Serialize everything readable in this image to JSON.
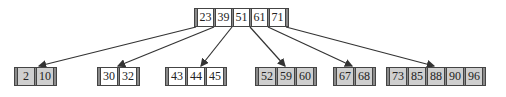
{
  "diagram": {
    "type": "b-tree",
    "root": {
      "keys": [
        "23",
        "39",
        "51",
        "61",
        "71"
      ],
      "fill": "white"
    },
    "leaves": [
      {
        "keys": [
          "2",
          "10"
        ],
        "fill": "gray"
      },
      {
        "keys": [
          "30",
          "32"
        ],
        "fill": "white"
      },
      {
        "keys": [
          "43",
          "44",
          "45"
        ],
        "fill": "white"
      },
      {
        "keys": [
          "52",
          "59",
          "60"
        ],
        "fill": "gray"
      },
      {
        "keys": [
          "67",
          "68"
        ],
        "fill": "gray"
      },
      {
        "keys": [
          "73",
          "85",
          "88",
          "90",
          "96"
        ],
        "fill": "gray"
      }
    ],
    "colors": {
      "leaf_gray": "#cfcfcf",
      "pointer_bar": "#8a8a8a",
      "edge": "#333333"
    }
  }
}
